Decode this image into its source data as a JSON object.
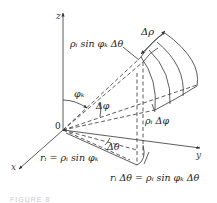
{
  "figure": {
    "axes": {
      "x": "x",
      "y": "y",
      "z": "z",
      "origin": "0"
    },
    "labels": {
      "delta_rho": "Δρ",
      "top_arc": "ρᵢ sin φₖ Δθ",
      "phi_k": "φₖ",
      "delta_phi": "Δφ",
      "rho_delta_phi": "ρᵢ Δφ",
      "delta_theta": "Δθ",
      "r_i_eq": "rᵢ = ρᵢ sin φₖ",
      "bottom_arc": "rᵢ Δθ = ρᵢ sin φₖ Δθ"
    },
    "caption": "FIGURE 8"
  }
}
